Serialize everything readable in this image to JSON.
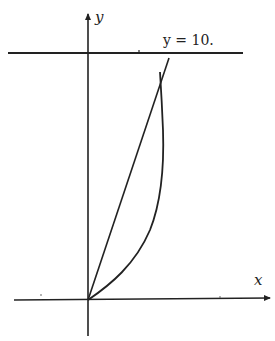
{
  "diagram": {
    "type": "graph-sketch",
    "axes": {
      "x_label": "x",
      "y_label": "y"
    },
    "horizontal_line": {
      "label": "y = 10."
    },
    "elements": [
      {
        "id": "line-through-origin",
        "kind": "straight-line",
        "from": "origin",
        "to": "upper-right crossing y=10"
      },
      {
        "id": "curve",
        "kind": "curve",
        "from": "origin",
        "description": "concave curve rising to intersect the straight line near y=10"
      }
    ],
    "colors": {
      "stroke": "#222222",
      "background": "#ffffff"
    }
  }
}
